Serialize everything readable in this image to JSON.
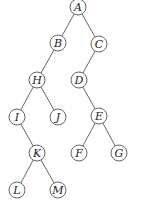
{
  "diagram": {
    "type": "binary-tree",
    "nodes": [
      {
        "id": "A",
        "label": "A",
        "x": 78,
        "y": 7
      },
      {
        "id": "B",
        "label": "B",
        "x": 58,
        "y": 43
      },
      {
        "id": "C",
        "label": "C",
        "x": 99,
        "y": 44
      },
      {
        "id": "H",
        "label": "H",
        "x": 37,
        "y": 80
      },
      {
        "id": "D",
        "label": "D",
        "x": 79,
        "y": 80
      },
      {
        "id": "I",
        "label": "I",
        "x": 17,
        "y": 117
      },
      {
        "id": "J",
        "label": "J",
        "x": 58,
        "y": 117
      },
      {
        "id": "E",
        "label": "E",
        "x": 99,
        "y": 116
      },
      {
        "id": "K",
        "label": "K",
        "x": 37,
        "y": 153
      },
      {
        "id": "F",
        "label": "F",
        "x": 79,
        "y": 153
      },
      {
        "id": "G",
        "label": "G",
        "x": 119,
        "y": 153
      },
      {
        "id": "L",
        "label": "L",
        "x": 17,
        "y": 190
      },
      {
        "id": "M",
        "label": "M",
        "x": 58,
        "y": 190
      }
    ],
    "edges": [
      [
        "A",
        "B"
      ],
      [
        "A",
        "C"
      ],
      [
        "B",
        "H"
      ],
      [
        "C",
        "D"
      ],
      [
        "H",
        "I"
      ],
      [
        "H",
        "J"
      ],
      [
        "D",
        "E"
      ],
      [
        "I",
        "K"
      ],
      [
        "E",
        "F"
      ],
      [
        "E",
        "G"
      ],
      [
        "K",
        "L"
      ],
      [
        "K",
        "M"
      ]
    ],
    "radius": 8
  }
}
